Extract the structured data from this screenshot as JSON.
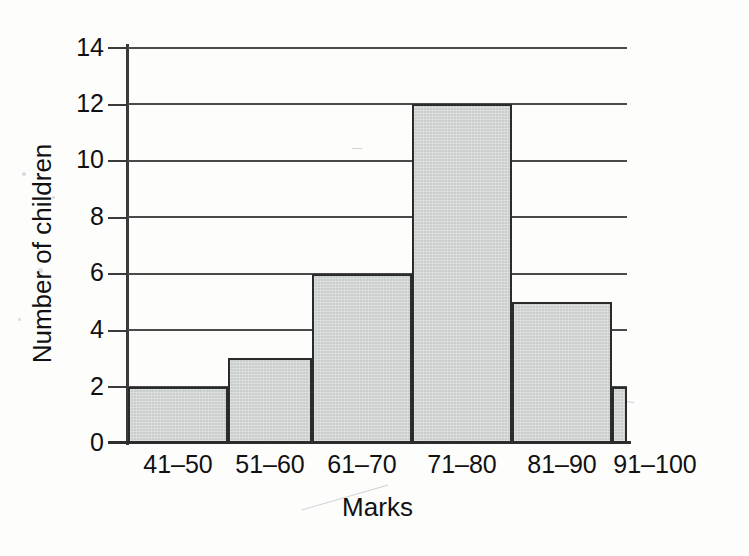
{
  "chart_data": {
    "type": "bar",
    "title": "",
    "xlabel": "Marks",
    "ylabel": "Number of children",
    "categories": [
      "41–50",
      "51–60",
      "61–70",
      "71–80",
      "81–90",
      "91–100"
    ],
    "values": [
      2,
      3,
      6,
      12,
      5,
      2
    ],
    "ylim": [
      0,
      14
    ],
    "ytick_step": 2,
    "yticks": [
      0,
      2,
      4,
      6,
      8,
      10,
      12,
      14
    ],
    "ytick_labels": [
      "0",
      "2",
      "4",
      "6",
      "8",
      "10",
      "12",
      "14"
    ],
    "grid": true,
    "grid_axis": "y",
    "legend": false,
    "legend_position": "none",
    "bar_fill_color": "#c9cecd",
    "bar_edge_color": "#2b2b2b",
    "axis_color": "#3a3a3a",
    "gridline_color": "#4a4a4a",
    "background_color": "#fdfdfc",
    "text_color": "#111111",
    "bars_contiguous": true
  }
}
